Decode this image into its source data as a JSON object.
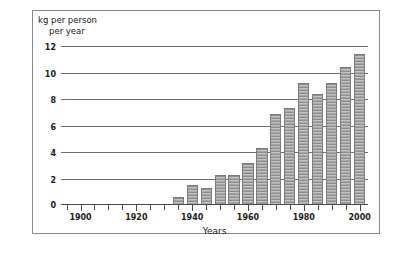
{
  "figure": {
    "y_axis_title_line1": "kg per person",
    "y_axis_title_line2": "per year",
    "x_axis_title": "Years"
  },
  "chart_data": {
    "type": "bar",
    "title": "",
    "subtitle": "",
    "xlabel": "Years",
    "ylabel": "kg per person per year",
    "xlim": [
      1893,
      2003
    ],
    "ylim": [
      0,
      12
    ],
    "grid": true,
    "legend": "none",
    "y_ticks": [
      0,
      2,
      4,
      6,
      8,
      10,
      12
    ],
    "y_tick_labels": [
      "0",
      "2",
      "4",
      "6",
      "8",
      "10",
      "12"
    ],
    "x_ticks": [
      1895,
      1900,
      1905,
      1910,
      1915,
      1920,
      1925,
      1930,
      1935,
      1940,
      1945,
      1950,
      1955,
      1960,
      1965,
      1970,
      1975,
      1980,
      1985,
      1990,
      1995,
      2000
    ],
    "x_tick_labels_shown": [
      "1900",
      "1920",
      "1940",
      "1960",
      "1980",
      "2000"
    ],
    "x_labeled_ticks": [
      1900,
      1920,
      1940,
      1960,
      1980,
      2000
    ],
    "bar_width_years": 4,
    "categories": [
      1935,
      1940,
      1945,
      1950,
      1955,
      1960,
      1965,
      1970,
      1975,
      1980,
      1985,
      1990,
      1995,
      2000
    ],
    "values": [
      0.6,
      1.5,
      1.3,
      2.3,
      2.3,
      3.2,
      4.3,
      6.9,
      7.3,
      9.2,
      8.4,
      9.2,
      10.4,
      11.4
    ]
  }
}
